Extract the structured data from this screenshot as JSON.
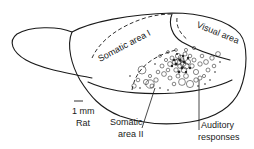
{
  "figure": {
    "subject": "Rat",
    "scale_bar_label": "1 mm",
    "species_label": "Rat",
    "colors": {
      "ink": "#1a1a1a",
      "background": "#ffffff"
    }
  },
  "labels": {
    "somatic_area_1": "Somatic area I",
    "visual_area": "Visual area",
    "somatic_area_2_line1": "Somatic",
    "somatic_area_2_line2": "area II",
    "auditory_line1": "Auditory",
    "auditory_line2": "responses"
  }
}
